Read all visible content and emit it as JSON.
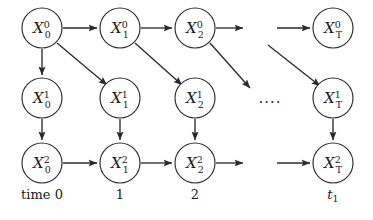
{
  "figure": {
    "background_color": "#ffffff",
    "stroke_color": "#2b2b2b",
    "text_color": "#1a1a1a",
    "width": 373,
    "height": 220
  },
  "nodes": [
    {
      "id": "x00",
      "base": "X",
      "sup": "0",
      "sub": "0",
      "cx": 42,
      "cy": 28,
      "r": 20,
      "row": 0,
      "col": 0
    },
    {
      "id": "x10",
      "base": "X",
      "sup": "0",
      "sub": "1",
      "cx": 120,
      "cy": 28,
      "r": 20,
      "row": 0,
      "col": 1
    },
    {
      "id": "x20",
      "base": "X",
      "sup": "0",
      "sub": "2",
      "cx": 195,
      "cy": 28,
      "r": 20,
      "row": 0,
      "col": 2
    },
    {
      "id": "xT0",
      "base": "X",
      "sup": "0",
      "sub": "T",
      "cx": 333,
      "cy": 28,
      "r": 20,
      "row": 0,
      "col": 3
    },
    {
      "id": "x01",
      "base": "X",
      "sup": "1",
      "sub": "0",
      "cx": 42,
      "cy": 98,
      "r": 20,
      "row": 1,
      "col": 0
    },
    {
      "id": "x11",
      "base": "X",
      "sup": "1",
      "sub": "1",
      "cx": 120,
      "cy": 98,
      "r": 20,
      "row": 1,
      "col": 1
    },
    {
      "id": "x21",
      "base": "X",
      "sup": "1",
      "sub": "2",
      "cx": 195,
      "cy": 98,
      "r": 20,
      "row": 1,
      "col": 2
    },
    {
      "id": "xT1",
      "base": "X",
      "sup": "1",
      "sub": "T",
      "cx": 333,
      "cy": 98,
      "r": 20,
      "row": 1,
      "col": 3
    },
    {
      "id": "x02",
      "base": "X",
      "sup": "2",
      "sub": "0",
      "cx": 42,
      "cy": 163,
      "r": 20,
      "row": 2,
      "col": 0
    },
    {
      "id": "x12",
      "base": "X",
      "sup": "2",
      "sub": "1",
      "cx": 120,
      "cy": 163,
      "r": 20,
      "row": 2,
      "col": 1
    },
    {
      "id": "x22",
      "base": "X",
      "sup": "2",
      "sub": "2",
      "cx": 195,
      "cy": 163,
      "r": 20,
      "row": 2,
      "col": 2
    },
    {
      "id": "xT2",
      "base": "X",
      "sup": "2",
      "sub": "T",
      "cx": 333,
      "cy": 163,
      "r": 20,
      "row": 2,
      "col": 3
    }
  ],
  "edges": [
    {
      "id": "e-x00-x10",
      "from": "x00",
      "to": "x10",
      "kind": "horizontal-top"
    },
    {
      "id": "e-x10-x20",
      "from": "x10",
      "to": "x20",
      "kind": "horizontal-top"
    },
    {
      "id": "e-x20-gap",
      "from": "x20",
      "to": "gap",
      "kind": "horizontal-top-truncated"
    },
    {
      "id": "e-gap-xT0",
      "from": "gap",
      "to": "xT0",
      "kind": "horizontal-top-resume"
    },
    {
      "id": "e-x00-x01",
      "from": "x00",
      "to": "x01",
      "kind": "vertical"
    },
    {
      "id": "e-x00-x11",
      "from": "x00",
      "to": "x11",
      "kind": "diagonal"
    },
    {
      "id": "e-x10-x21",
      "from": "x10",
      "to": "x21",
      "kind": "diagonal"
    },
    {
      "id": "e-x20-gap1",
      "from": "x20",
      "to": "gap",
      "kind": "diagonal-truncated"
    },
    {
      "id": "e-gap-xT1",
      "from": "gap",
      "to": "xT1",
      "kind": "diagonal-resume"
    },
    {
      "id": "e-x01-x02",
      "from": "x01",
      "to": "x02",
      "kind": "vertical"
    },
    {
      "id": "e-x11-x12",
      "from": "x11",
      "to": "x12",
      "kind": "vertical"
    },
    {
      "id": "e-x21-x22",
      "from": "x21",
      "to": "x22",
      "kind": "vertical"
    },
    {
      "id": "e-xT1-xT2",
      "from": "xT1",
      "to": "xT2",
      "kind": "vertical"
    },
    {
      "id": "e-x02-x12",
      "from": "x02",
      "to": "x12",
      "kind": "horizontal-bottom"
    },
    {
      "id": "e-x12-x22",
      "from": "x12",
      "to": "x22",
      "kind": "horizontal-bottom"
    },
    {
      "id": "e-x22-gap",
      "from": "x22",
      "to": "gap",
      "kind": "horizontal-bottom-truncated"
    },
    {
      "id": "e-gap-xT2",
      "from": "gap",
      "to": "xT2",
      "kind": "horizontal-bottom-resume"
    }
  ],
  "ellipsis": {
    "text": "....",
    "x": 270,
    "y": 103
  },
  "time_axis": {
    "labels": [
      {
        "id": "time-0",
        "text": "time 0",
        "x": 42,
        "y": 199,
        "italic": false
      },
      {
        "id": "time-1",
        "text": "1",
        "x": 120,
        "y": 199,
        "italic": false
      },
      {
        "id": "time-2",
        "text": "2",
        "x": 195,
        "y": 199,
        "italic": false
      },
      {
        "id": "time-t1",
        "text": "t",
        "sub": "1",
        "x": 333,
        "y": 199,
        "italic": true
      }
    ]
  }
}
